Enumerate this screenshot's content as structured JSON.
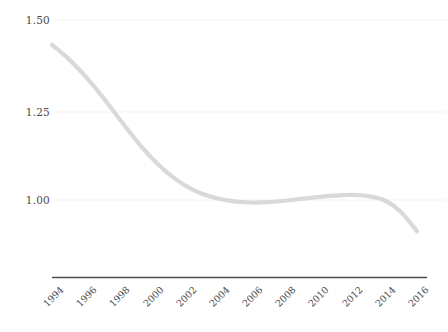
{
  "chart_data": {
    "type": "line",
    "title": "",
    "subtitle": "",
    "xlabel": "",
    "ylabel": "",
    "x": [
      1994,
      1995,
      1996,
      1997,
      1998,
      1999,
      2000,
      2001,
      2002,
      2003,
      2004,
      2005,
      2006,
      2007,
      2008,
      2009,
      2010,
      2011,
      2012,
      2013,
      2014,
      2015,
      2016
    ],
    "series": [
      {
        "name": "",
        "values": [
          1.431,
          1.392,
          1.344,
          1.289,
          1.229,
          1.17,
          1.117,
          1.074,
          1.041,
          1.018,
          1.004,
          0.996,
          0.993,
          0.994,
          0.998,
          1.003,
          1.008,
          1.012,
          1.014,
          1.011,
          1.0,
          0.968,
          0.913
        ]
      }
    ],
    "xlim": [
      1994,
      2016.6
    ],
    "ylim": [
      0.895,
      1.515
    ],
    "yticks": [
      1.0,
      1.25,
      1.5
    ],
    "ytick_labels": [
      "1.00",
      "1.25",
      "1.50"
    ],
    "xticks": [
      1994,
      1996,
      1998,
      2000,
      2002,
      2004,
      2006,
      2008,
      2010,
      2012,
      2014,
      2016
    ],
    "xtick_labels": [
      "1994",
      "1996",
      "1998",
      "2000",
      "2002",
      "2004",
      "2006",
      "2008",
      "2010",
      "2012",
      "2014",
      "2016"
    ],
    "xtick_rotation": -45,
    "grid": {
      "horizontal": true,
      "vertical": false,
      "color": "#f3f3f3"
    },
    "legend": {
      "visible": false,
      "position": "none",
      "entries": []
    },
    "colors": {
      "line": "#d9d9d9",
      "axis": "#4d4d4d",
      "grid": "#f3f3f3",
      "tick_text": "#4a4a4a",
      "background": "#ffffff"
    },
    "line_width": 4.2,
    "axes": {
      "bottom_spine": true,
      "left_spine": false,
      "top_spine": false,
      "right_spine": false
    }
  }
}
